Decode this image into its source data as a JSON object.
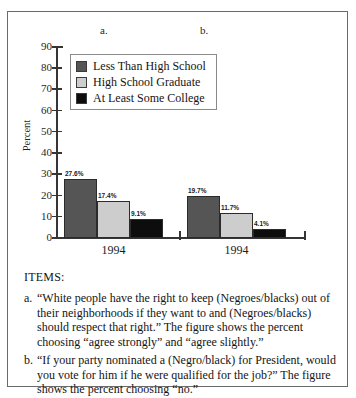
{
  "figure": {
    "panel_letters": {
      "a": "a.",
      "b": "b."
    },
    "items_heading": "ITEMS:",
    "items": [
      {
        "marker": "a.",
        "text": "“White people have the right to keep (Negroes/blacks) out of their neighborhoods if they want to and (Negroes/blacks) should respect that right.” The figure shows the percent choosing “agree strongly” and “agree slightly.”"
      },
      {
        "marker": "b.",
        "text": "“If your party nominated a (Negro/black) for President, would you vote for him if he were qualified for the job?” The figure shows the percent choosing “no.”"
      }
    ]
  },
  "chart_data": {
    "type": "bar",
    "title": "",
    "xlabel": "",
    "ylabel": "Percent",
    "ylim": [
      0,
      90
    ],
    "yticks": [
      0,
      10,
      20,
      30,
      40,
      50,
      60,
      70,
      80,
      90
    ],
    "ytick_labels": [
      "0",
      "10",
      "20",
      "30",
      "40",
      "50",
      "60",
      "70",
      "80",
      "90"
    ],
    "grid": false,
    "legend_position": "upper-left-inside",
    "categories": [
      "1994",
      "1994"
    ],
    "panels": [
      "a.",
      "b."
    ],
    "series": [
      {
        "name": "Less Than High School",
        "color": "#555555",
        "values": [
          27.6,
          19.7
        ],
        "data_labels": [
          "27.6%",
          "19.7%"
        ]
      },
      {
        "name": "High School Graduate",
        "color": "#cdcdcd",
        "values": [
          17.4,
          11.7
        ],
        "data_labels": [
          "17.4%",
          "11.7%"
        ]
      },
      {
        "name": "At Least Some College",
        "color": "#0d0d0d",
        "values": [
          9.1,
          4.1
        ],
        "data_labels": [
          "9.1%",
          "4.1%"
        ]
      }
    ]
  }
}
